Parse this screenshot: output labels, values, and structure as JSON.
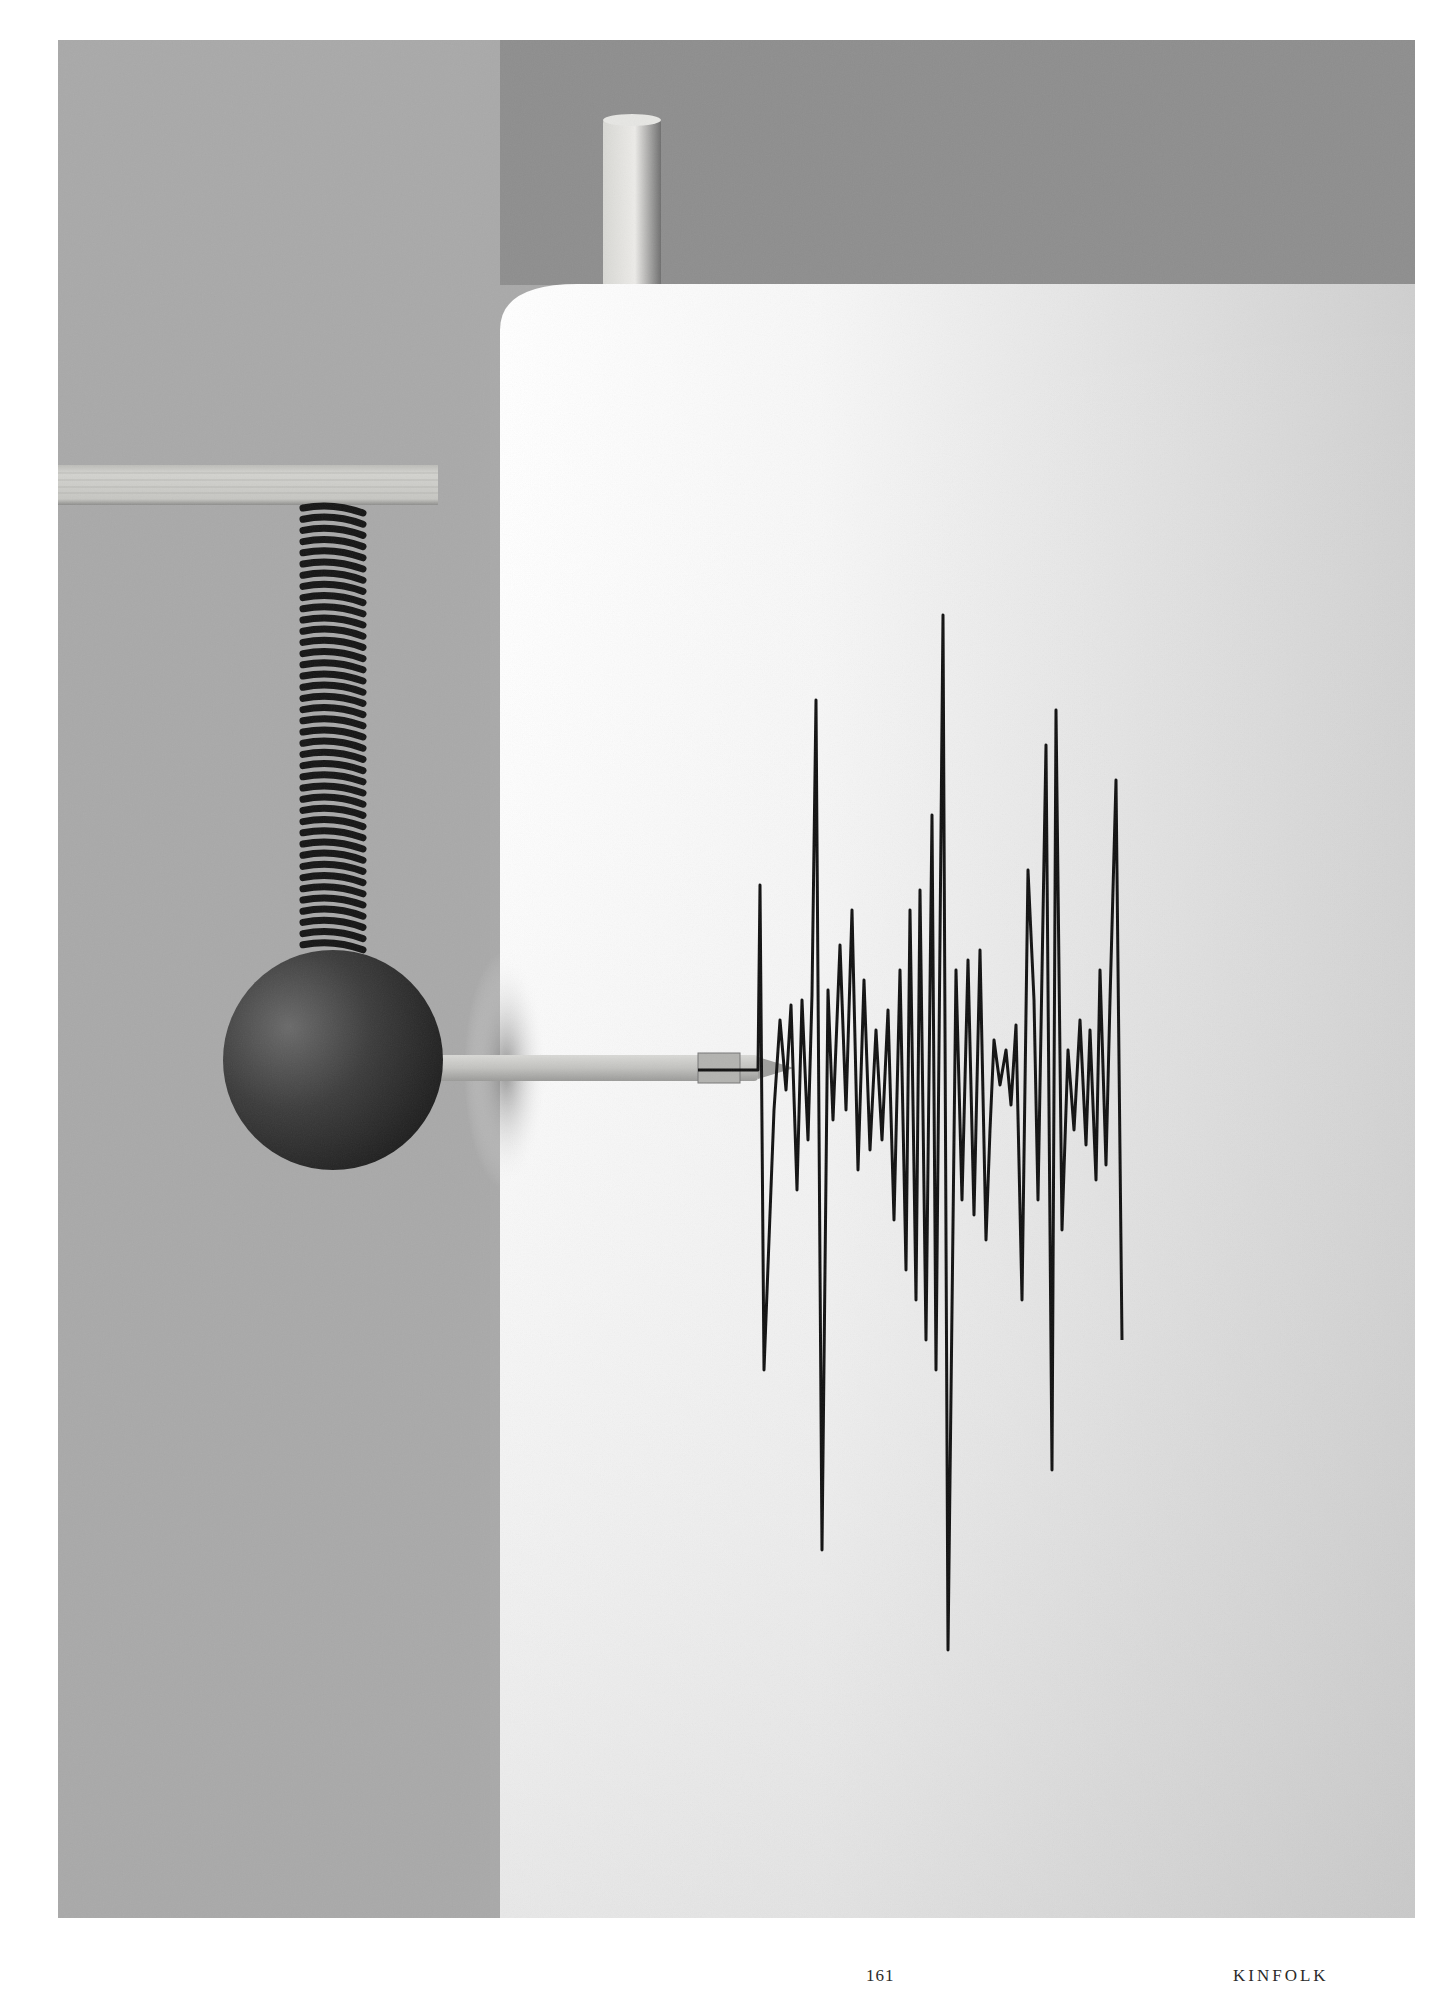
{
  "page": {
    "number": "161",
    "publication": "KINFOLK"
  },
  "photo": {
    "description": "Seismograph-style still life: wooden ball hanging from a coiled spring on a shelf, a pen attached to the ball draws a jagged seismic waveform on a white paper drum",
    "elements": [
      "wall-background",
      "wooden-dowel",
      "paper-drum",
      "wooden-shelf",
      "coil-spring",
      "wooden-ball",
      "pen",
      "seismic-waveform"
    ],
    "colors": {
      "wall": "#a9a9a9",
      "wall_upper_right": "#8c8c8c",
      "paper": "#f4f4f4",
      "ink": "#111111",
      "ball": "#3a3a3a",
      "wood": "#c9c9c4"
    }
  }
}
